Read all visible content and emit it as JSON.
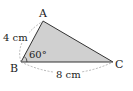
{
  "figure": {
    "type": "triangle",
    "vertices": {
      "A": {
        "label": "A",
        "x": 43,
        "y": 21
      },
      "B": {
        "label": "B",
        "x": 21,
        "y": 62
      },
      "C": {
        "label": "C",
        "x": 113,
        "y": 62
      }
    },
    "fill_color": "#cfcfcf",
    "stroke_color": "#333333",
    "dimension_color": "#999999",
    "measurements": {
      "AB": "4 cm",
      "BC": "8 cm",
      "angle_B": "60°"
    }
  }
}
